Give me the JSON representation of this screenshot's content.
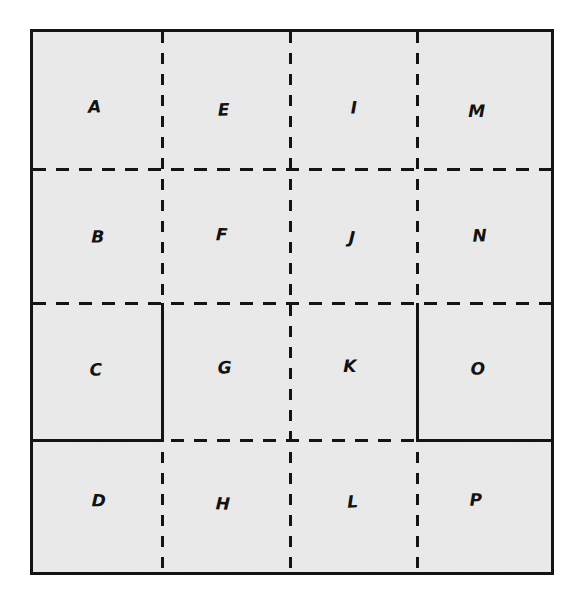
{
  "diagram": {
    "kind": "grid-partition-diagram",
    "background_color": "#ffffff",
    "cell_fill_color": "#ededed",
    "line_color": "#141414",
    "plate": {
      "left": 33,
      "top": 32,
      "right": 551,
      "bottom": 572
    },
    "columns": 4,
    "rows": 4,
    "column_dividers_x": [
      162,
      290,
      417
    ],
    "row_dividers_y": [
      169,
      303,
      440
    ],
    "outer_border_style": "solid",
    "inner_divider_style": "dashed",
    "cells": [
      {
        "id": "cell-a",
        "label": "A",
        "row": 1,
        "col": 1,
        "cx": 97,
        "cy": 110
      },
      {
        "id": "cell-e",
        "label": "E",
        "row": 1,
        "col": 2,
        "cx": 224,
        "cy": 110
      },
      {
        "id": "cell-i",
        "label": "I",
        "row": 1,
        "col": 3,
        "cx": 352,
        "cy": 110
      },
      {
        "id": "cell-m",
        "label": "M",
        "row": 1,
        "col": 4,
        "cx": 478,
        "cy": 110
      },
      {
        "id": "cell-b",
        "label": "B",
        "row": 2,
        "col": 1,
        "cx": 97,
        "cy": 238
      },
      {
        "id": "cell-f",
        "label": "F",
        "row": 2,
        "col": 2,
        "cx": 224,
        "cy": 238
      },
      {
        "id": "cell-j",
        "label": "J",
        "row": 2,
        "col": 3,
        "cx": 352,
        "cy": 238
      },
      {
        "id": "cell-n",
        "label": "N",
        "row": 2,
        "col": 4,
        "cx": 478,
        "cy": 238
      },
      {
        "id": "cell-c",
        "label": "C",
        "row": 3,
        "col": 1,
        "cx": 97,
        "cy": 369
      },
      {
        "id": "cell-g",
        "label": "G",
        "row": 3,
        "col": 2,
        "cx": 224,
        "cy": 369
      },
      {
        "id": "cell-k",
        "label": "K",
        "row": 3,
        "col": 3,
        "cx": 352,
        "cy": 369
      },
      {
        "id": "cell-o",
        "label": "O",
        "row": 3,
        "col": 4,
        "cx": 478,
        "cy": 369
      },
      {
        "id": "cell-d",
        "label": "D",
        "row": 4,
        "col": 1,
        "cx": 97,
        "cy": 503
      },
      {
        "id": "cell-h",
        "label": "H",
        "row": 4,
        "col": 2,
        "cx": 224,
        "cy": 503
      },
      {
        "id": "cell-l",
        "label": "L",
        "row": 4,
        "col": 3,
        "cx": 352,
        "cy": 503
      },
      {
        "id": "cell-p",
        "label": "P",
        "row": 4,
        "col": 4,
        "cx": 478,
        "cy": 503
      }
    ],
    "emphasized_solid_segments": [
      {
        "id": "solid-right-of-c",
        "orientation": "vertical",
        "x": 162,
        "y1": 303,
        "y2": 441
      },
      {
        "id": "solid-below-c",
        "orientation": "horizontal",
        "y": 440,
        "x1": 33,
        "x2": 164
      },
      {
        "id": "solid-left-of-o",
        "orientation": "vertical",
        "x": 417,
        "y1": 303,
        "y2": 441
      },
      {
        "id": "solid-below-o",
        "orientation": "horizontal",
        "y": 440,
        "x1": 417,
        "x2": 551
      }
    ]
  }
}
